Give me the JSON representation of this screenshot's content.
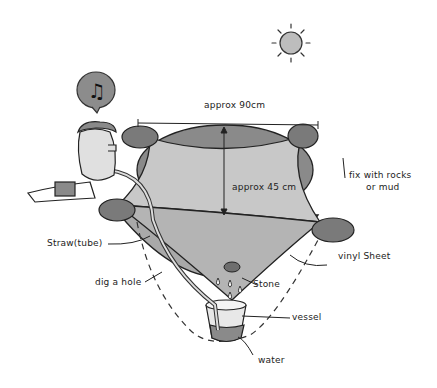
{
  "labels": {
    "width": "approx 90cm",
    "depth": "approx 45 cm",
    "fix": "fix with rocks",
    "fix2": "or mud",
    "straw": "Straw(tube)",
    "hole": "dig a hole",
    "vinyl": "vinyl Sheet",
    "stone": "Stone",
    "vessel": "vessel",
    "water": "water"
  },
  "colors": {
    "sheet": "#c8c8c8",
    "pit": "#8a8a8a",
    "rock": "#7a7a7a",
    "line": "#222222"
  }
}
